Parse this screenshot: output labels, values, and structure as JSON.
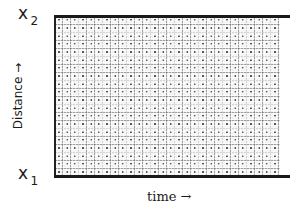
{
  "diagram": {
    "type": "space-time region",
    "top_label": {
      "main": "x",
      "subscript": "2"
    },
    "bottom_label": {
      "main": "x",
      "subscript": "1"
    },
    "y_axis_label": "Distance →",
    "x_axis_label": "time →",
    "fill_pattern": "dotted grid texture",
    "colors": {
      "border": "#1a1a1a",
      "texture": "#555555",
      "background": "#ffffff"
    }
  }
}
